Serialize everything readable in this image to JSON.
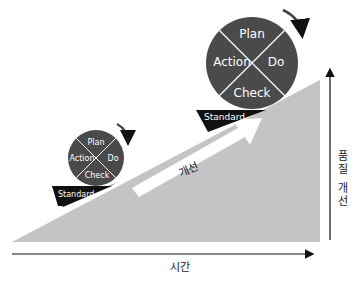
{
  "diagram": {
    "colors": {
      "slope": "#c4c4c4",
      "circle": "#4a4a4a",
      "wedge": "#111111",
      "text_light": "#ffffff",
      "arrow": "#111111"
    },
    "large_cycle": {
      "top": "Plan",
      "right": "Do",
      "bottom": "Check",
      "left": "Action",
      "base": "Standard"
    },
    "small_cycle": {
      "top": "Plan",
      "right": "Do",
      "bottom": "Check",
      "left": "Action",
      "base": "Standard"
    },
    "improve_arrow_label": "개선",
    "x_axis_label": "시간",
    "y_axis_label": [
      "품",
      "질",
      "개",
      "선"
    ]
  }
}
